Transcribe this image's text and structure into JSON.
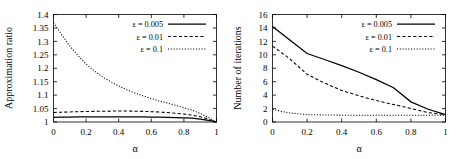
{
  "figure": {
    "title": "",
    "panels": [
      "approximation-ratio",
      "number-of-iterations"
    ]
  },
  "chart_data": [
    {
      "type": "line",
      "title": "",
      "xlabel": "α",
      "ylabel": "Approximation ratio",
      "xlim": [
        0,
        1
      ],
      "ylim": [
        1,
        1.4
      ],
      "xticks": [
        "0",
        "0.2",
        "0.4",
        "0.6",
        "0.8",
        "1"
      ],
      "xtickvals": [
        0,
        0.2,
        0.4,
        0.6,
        0.8,
        1
      ],
      "yticks": [
        "1",
        "1.05",
        "1.1",
        "1.15",
        "1.2",
        "1.25",
        "1.3",
        "1.35",
        "1.4"
      ],
      "ytickvals": [
        1,
        1.05,
        1.1,
        1.15,
        1.2,
        1.25,
        1.3,
        1.35,
        1.4
      ],
      "grid": false,
      "legend_position": "top-right",
      "x": [
        0,
        0.05,
        0.1,
        0.15,
        0.2,
        0.25,
        0.3,
        0.35,
        0.4,
        0.45,
        0.5,
        0.55,
        0.6,
        0.65,
        0.7,
        0.75,
        0.8,
        0.85,
        0.9,
        0.95,
        1
      ],
      "series": [
        {
          "name": "ε = 0.005",
          "style": "solid",
          "values": [
            1.017,
            1.018,
            1.018,
            1.019,
            1.019,
            1.019,
            1.019,
            1.019,
            1.019,
            1.019,
            1.019,
            1.019,
            1.018,
            1.018,
            1.017,
            1.016,
            1.015,
            1.014,
            1.011,
            1.006,
            1.0
          ]
        },
        {
          "name": "ε = 0.01",
          "style": "dashed",
          "values": [
            1.0355,
            1.0365,
            1.0375,
            1.0385,
            1.039,
            1.0395,
            1.04,
            1.0405,
            1.041,
            1.0408,
            1.0403,
            1.0396,
            1.0385,
            1.037,
            1.035,
            1.0325,
            1.0295,
            1.0255,
            1.0195,
            1.011,
            1.0
          ]
        },
        {
          "name": "ε = 0.1",
          "style": "dotted",
          "values": [
            1.37,
            1.325,
            1.283,
            1.247,
            1.216,
            1.19,
            1.168,
            1.15,
            1.134,
            1.12,
            1.108,
            1.097,
            1.087,
            1.078,
            1.07,
            1.062,
            1.053,
            1.044,
            1.032,
            1.017,
            1.0
          ]
        }
      ]
    },
    {
      "type": "line",
      "title": "",
      "xlabel": "α",
      "ylabel": "Number of iterations",
      "xlim": [
        0,
        1
      ],
      "ylim": [
        0,
        16
      ],
      "xticks": [
        "0",
        "0.2",
        "0.4",
        "0.6",
        "0.8",
        "1"
      ],
      "xtickvals": [
        0,
        0.2,
        0.4,
        0.6,
        0.8,
        1
      ],
      "yticks": [
        "0",
        "2",
        "4",
        "6",
        "8",
        "10",
        "12",
        "14",
        "16"
      ],
      "ytickvals": [
        0,
        2,
        4,
        6,
        8,
        10,
        12,
        14,
        16
      ],
      "grid": false,
      "legend_position": "top-right",
      "x": [
        0,
        0.1,
        0.2,
        0.3,
        0.4,
        0.5,
        0.6,
        0.7,
        0.8,
        0.9,
        1
      ],
      "series": [
        {
          "name": "ε = 0.005",
          "style": "solid",
          "values": [
            14.2,
            12.2,
            10.2,
            9.3,
            8.4,
            7.4,
            6.3,
            5.1,
            3.0,
            1.9,
            1.1
          ]
        },
        {
          "name": "ε = 0.01",
          "style": "dashed",
          "values": [
            11.3,
            9.4,
            7.1,
            5.8,
            4.7,
            3.9,
            3.2,
            2.6,
            2.0,
            1.4,
            1.1
          ]
        },
        {
          "name": "ε = 0.1",
          "style": "dotted",
          "values": [
            1.85,
            1.35,
            1.1,
            1.05,
            1.02,
            1.0,
            1.0,
            1.0,
            1.0,
            1.0,
            1.0
          ]
        }
      ]
    }
  ]
}
